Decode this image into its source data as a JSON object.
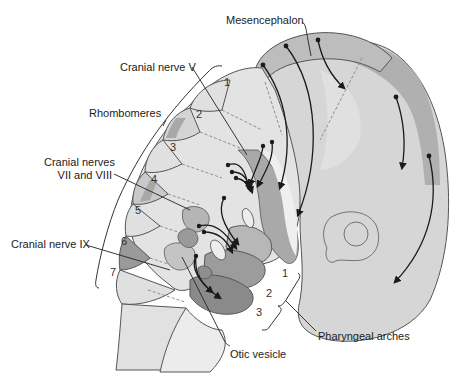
{
  "diagram": {
    "labels": {
      "mesencephalon": "Mesencephalon",
      "cranial_nerve_v": "Cranial nerve V",
      "rhombomeres": "Rhombomeres",
      "cranial_nerves_vii_viii_line1": "Cranial nerves",
      "cranial_nerves_vii_viii_line2": "VII and VIII",
      "cranial_nerve_ix": "Cranial nerve IX",
      "otic_vesicle": "Otic vesicle",
      "pharyngeal_arches": "Pharyngeal arches"
    },
    "rhombomere_numbers": [
      "1",
      "2",
      "3",
      "4",
      "5",
      "6",
      "7"
    ],
    "arch_numbers": [
      "1",
      "2",
      "3"
    ],
    "colors": {
      "background": "#ffffff",
      "light_tissue": "#e4e4e4",
      "mid_tissue": "#cfcfcf",
      "band_tissue": "#b3b3b3",
      "dark_tissue": "#8f8f8f",
      "outline": "#555555",
      "arrow": "#1a1a1a",
      "text": "#222222"
    }
  }
}
